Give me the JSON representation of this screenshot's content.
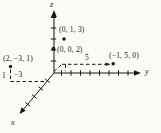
{
  "figure": {
    "type": "3d-coordinate-axes-diagram",
    "axes": {
      "x": {
        "label": "x"
      },
      "y": {
        "label": "y"
      },
      "z": {
        "label": "z"
      }
    },
    "points": [
      {
        "coords": [
          0,
          1,
          3
        ],
        "label": "(0, 1, 3)"
      },
      {
        "coords": [
          0,
          0,
          2
        ],
        "label": "(0, 0, 2)"
      },
      {
        "coords": [
          2,
          -3,
          1
        ],
        "label": "(2, −3, 1)"
      },
      {
        "coords": [
          -1,
          5,
          0
        ],
        "label": "(−1, 5, 0)"
      }
    ],
    "measure_labels": [
      {
        "value": 5,
        "label": "5"
      },
      {
        "value": 1,
        "label": "1"
      },
      {
        "value": -3,
        "label": "−3"
      }
    ],
    "colors": {
      "ink": "#161616",
      "background": "#fbfaf7"
    }
  }
}
